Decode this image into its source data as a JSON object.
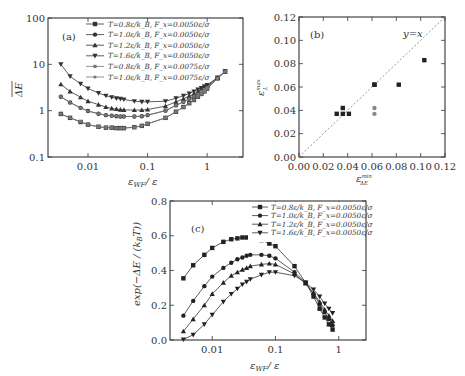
{
  "chart_data": [
    {
      "panel": "(a)",
      "type": "line",
      "xscale": "log",
      "yscale": "log",
      "xlabel": "ε_WF / ε",
      "ylabel": "ΔE (overbar)",
      "xticks": [
        "0.01",
        "0.1",
        "1"
      ],
      "yticks": [
        "0.1",
        "1",
        "10",
        "100"
      ],
      "xlim": [
        0.00213,
        4.0
      ],
      "ylim": [
        0.1,
        100
      ],
      "legend_position": "upper right",
      "x": [
        0.0035,
        0.005,
        0.0075,
        0.01,
        0.015,
        0.02,
        0.025,
        0.03,
        0.035,
        0.04,
        0.06,
        0.08,
        0.1,
        0.2,
        0.3,
        0.4,
        0.5,
        0.6,
        0.7,
        0.8,
        0.9,
        1.0,
        1.5,
        2.0
      ],
      "series": [
        {
          "name": "T=0.8ε/k_B, F_x=0.0050ε/σ",
          "marker": "square",
          "color": "#333333",
          "values": [
            0.85,
            0.7,
            0.57,
            0.5,
            0.45,
            0.43,
            0.43,
            0.42,
            0.42,
            0.42,
            0.44,
            0.47,
            0.52,
            0.7,
            0.95,
            1.2,
            1.45,
            1.7,
            2.0,
            2.3,
            2.6,
            3.0,
            5.0,
            7.0
          ]
        },
        {
          "name": "T=1.0ε/k_B, F_x=0.0050ε/σ",
          "marker": "circle",
          "color": "#333333",
          "values": [
            2.0,
            1.5,
            1.15,
            0.98,
            0.86,
            0.8,
            0.78,
            0.76,
            0.75,
            0.75,
            0.75,
            0.76,
            0.8,
            1.0,
            1.3,
            1.55,
            1.8,
            2.05,
            2.3,
            2.6,
            2.9,
            3.2,
            5.0,
            7.0
          ]
        },
        {
          "name": "T=1.2ε/k_B, F_x=0.0050ε/σ",
          "marker": "triangle-up",
          "color": "#333333",
          "values": [
            3.7,
            2.6,
            1.95,
            1.6,
            1.35,
            1.2,
            1.12,
            1.08,
            1.05,
            1.04,
            1.03,
            1.03,
            1.06,
            1.25,
            1.55,
            1.8,
            2.05,
            2.3,
            2.55,
            2.8,
            3.05,
            3.35,
            5.1,
            7.0
          ]
        },
        {
          "name": "T=1.6ε/k_B, F_x=0.0050ε/σ",
          "marker": "triangle-down",
          "color": "#333333",
          "values": [
            10.0,
            5.5,
            3.8,
            3.0,
            2.4,
            2.1,
            1.95,
            1.85,
            1.8,
            1.75,
            1.6,
            1.55,
            1.55,
            1.6,
            1.85,
            2.1,
            2.35,
            2.6,
            2.85,
            3.1,
            3.35,
            3.6,
            5.2,
            7.0
          ]
        },
        {
          "name": "T=0.8ε/k_B, F_x=0.0075ε/σ",
          "marker": "square-small",
          "color": "#777777",
          "values": [
            0.85,
            0.7,
            0.58,
            0.5,
            0.45,
            0.43,
            0.43,
            0.42,
            0.42,
            0.42,
            0.44,
            0.47,
            0.52,
            0.7,
            0.95,
            1.2,
            1.45,
            1.7,
            2.0,
            2.3,
            2.6,
            3.0,
            5.0,
            7.0
          ]
        },
        {
          "name": "T=1.0ε/k_B, F_x=0.0075ε/σ",
          "marker": "circle-small",
          "color": "#777777",
          "values": [
            2.0,
            1.5,
            1.15,
            0.98,
            0.86,
            0.8,
            0.78,
            0.76,
            0.75,
            0.75,
            0.75,
            0.76,
            0.8,
            1.0,
            1.3,
            1.55,
            1.8,
            2.05,
            2.3,
            2.6,
            2.9,
            3.2,
            5.0,
            7.0
          ]
        }
      ]
    },
    {
      "panel": "(b)",
      "type": "scatter",
      "xlabel": "ε_ΔE^min",
      "ylabel": "ε_{L_R}^max",
      "xticks": [
        "0.00",
        "0.02",
        "0.04",
        "0.06",
        "0.08",
        "0.10",
        "0.12"
      ],
      "yticks": [
        "0.00",
        "0.02",
        "0.04",
        "0.06",
        "0.08",
        "0.10",
        "0.12"
      ],
      "xlim": [
        0,
        0.12
      ],
      "ylim": [
        0,
        0.12
      ],
      "annotation": "y = x",
      "reference_line": "dashed diagonal y=x",
      "series": [
        {
          "name": "F_x=0.0050ε/σ",
          "color": "#222222",
          "marker": "square",
          "points": [
            [
              0.031,
              0.037
            ],
            [
              0.036,
              0.042
            ],
            [
              0.036,
              0.037
            ],
            [
              0.041,
              0.037
            ],
            [
              0.062,
              0.062
            ],
            [
              0.062,
              0.062
            ],
            [
              0.082,
              0.062
            ],
            [
              0.103,
              0.083
            ]
          ]
        },
        {
          "name": "F_x=0.0075ε/σ",
          "color": "#888888",
          "marker": "circle",
          "points": [
            [
              0.062,
              0.042
            ],
            [
              0.062,
              0.037
            ]
          ]
        }
      ]
    },
    {
      "panel": "(c)",
      "type": "line",
      "xscale": "log",
      "xlabel": "ε_WF / ε",
      "ylabel": "exp(−ΔE / (k_B T))",
      "xticks": [
        "0.01",
        "0.1",
        "1"
      ],
      "yticks": [
        "0.0",
        "0.2",
        "0.4",
        "0.6",
        "0.8"
      ],
      "xlim": [
        0.00215,
        2.7
      ],
      "ylim": [
        0,
        0.8
      ],
      "legend_position": "upper right",
      "x": [
        0.0035,
        0.005,
        0.0075,
        0.01,
        0.015,
        0.02,
        0.025,
        0.03,
        0.035,
        0.04,
        0.06,
        0.08,
        0.1,
        0.2,
        0.3,
        0.4,
        0.5,
        0.6,
        0.7,
        0.8
      ],
      "series": [
        {
          "name": "T=0.8ε/k_B, F_x=0.0050ε/σ",
          "marker": "square",
          "values": [
            0.355,
            0.43,
            0.49,
            0.53,
            0.565,
            0.58,
            0.585,
            0.59,
            0.59,
            0.59,
            0.575,
            0.555,
            0.54,
            0.425,
            0.33,
            0.25,
            0.18,
            0.13,
            0.09,
            0.06
          ]
        },
        {
          "name": "T=1.0ε/k_B, F_x=0.0050ε/σ",
          "marker": "circle",
          "values": [
            0.14,
            0.225,
            0.31,
            0.365,
            0.415,
            0.445,
            0.465,
            0.475,
            0.485,
            0.49,
            0.49,
            0.485,
            0.47,
            0.39,
            0.33,
            0.265,
            0.205,
            0.16,
            0.12,
            0.085
          ]
        },
        {
          "name": "T=1.2ε/k_B, F_x=0.0050ε/σ",
          "marker": "triangle-up",
          "values": [
            0.05,
            0.12,
            0.2,
            0.265,
            0.33,
            0.37,
            0.39,
            0.405,
            0.415,
            0.425,
            0.435,
            0.44,
            0.435,
            0.38,
            0.325,
            0.27,
            0.22,
            0.175,
            0.14,
            0.11
          ]
        },
        {
          "name": "T=1.6ε/k_B, F_x=0.0050ε/σ",
          "marker": "triangle-down",
          "values": [
            0.003,
            0.03,
            0.09,
            0.145,
            0.22,
            0.265,
            0.295,
            0.32,
            0.335,
            0.35,
            0.375,
            0.39,
            0.39,
            0.37,
            0.33,
            0.29,
            0.25,
            0.21,
            0.18,
            0.155
          ]
        }
      ]
    }
  ],
  "labels": {
    "panel_a": "(a)",
    "panel_b": "(b)",
    "panel_c": "(c)",
    "b_annotation": "y=x",
    "a_legend": [
      "T=0.8ε/k_B, F_x=0.0050ε/σ",
      "T=1.0ε/k_B, F_x=0.0050ε/σ",
      "T=1.2ε/k_B, F_x=0.0050ε/σ",
      "T=1.6ε/k_B, F_x=0.0050ε/σ",
      "T=0.8ε/k_B, F_x=0.0075ε/σ",
      "T=1.0ε/k_B, F_x=0.0075ε/σ"
    ],
    "c_legend": [
      "T=0.8ε/k_B, F_x=0.0050ε/σ",
      "T=1.0ε/k_B, F_x=0.0050ε/σ",
      "T=1.2ε/k_B, F_x=0.0050ε/σ",
      "T=1.6ε/k_B, F_x=0.0050ε/σ"
    ],
    "a_xlabel": "ε",
    "a_xlabel_sub": "WF",
    "a_xlabel_tail": "/ ε",
    "a_ylabel": "ΔE",
    "b_ylabel": "ε",
    "b_ylabel_sup": "max",
    "b_ylabel_sub": "L",
    "b_xlabel": "ε",
    "b_xlabel_sup": "min",
    "b_xlabel_sub": "ΔE",
    "c_ylabel": "exp(−ΔE / (k",
    "c_ylabel_sub": "B",
    "c_ylabel_tail": "T))",
    "c_xlabel": "ε",
    "c_xlabel_sub": "WF",
    "c_xlabel_tail": "/ ε"
  }
}
